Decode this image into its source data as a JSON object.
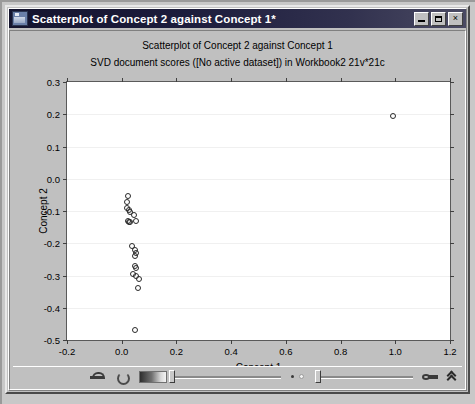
{
  "window": {
    "title": "Scatterplot of Concept 2 against Concept 1*",
    "icon": "chart-window-icon",
    "minimize_label": "",
    "maximize_label": "",
    "close_label": "×"
  },
  "toolbar": {
    "items": [
      {
        "name": "brush-tool-icon",
        "label": ""
      },
      {
        "name": "rotate-tool-icon",
        "label": ""
      },
      {
        "name": "gradient-swatch-icon",
        "label": ""
      },
      {
        "name": "marker-size-slider",
        "value": 0
      },
      {
        "name": "point-density-icon",
        "label": ""
      },
      {
        "name": "zoom-slider",
        "value": 0
      },
      {
        "name": "key-tool-icon",
        "label": ""
      },
      {
        "name": "collapse-chevron-icon",
        "label": ""
      }
    ]
  },
  "chart_data": {
    "type": "scatter",
    "title": "Scatterplot of Concept 2 against Concept 1",
    "subtitle": "SVD document scores ([No active dataset]) in Workbook2 21v*21c",
    "xlabel": "Concept 1",
    "ylabel": "Concept 2",
    "xlim": [
      -0.2,
      1.2
    ],
    "ylim": [
      -0.5,
      0.3
    ],
    "xticks": [
      "-0.2",
      "0.0",
      "0.2",
      "0.4",
      "0.6",
      "0.8",
      "1.0",
      "1.2"
    ],
    "xtick_values": [
      -0.2,
      0.0,
      0.2,
      0.4,
      0.6,
      0.8,
      1.0,
      1.2
    ],
    "yticks": [
      "0.3",
      "0.2",
      "0.1",
      "0.0",
      "-0.1",
      "-0.2",
      "-0.3",
      "-0.4",
      "-0.5"
    ],
    "ytick_values": [
      0.3,
      0.2,
      0.1,
      0.0,
      -0.1,
      -0.2,
      -0.3,
      -0.4,
      -0.5
    ],
    "grid": true,
    "grid_axis": "y",
    "legend": false,
    "marker": "open-circle",
    "marker_color": "#2a2a2a",
    "series": [
      {
        "name": "SVD document scores",
        "points": [
          [
            0.99,
            0.195
          ],
          [
            0.022,
            -0.052
          ],
          [
            0.021,
            -0.072
          ],
          [
            0.018,
            -0.09
          ],
          [
            0.026,
            -0.096
          ],
          [
            0.032,
            -0.104
          ],
          [
            0.046,
            -0.112
          ],
          [
            0.022,
            -0.132
          ],
          [
            0.027,
            -0.133
          ],
          [
            0.03,
            -0.134
          ],
          [
            0.052,
            -0.13
          ],
          [
            0.038,
            -0.21
          ],
          [
            0.05,
            -0.222
          ],
          [
            0.052,
            -0.23
          ],
          [
            0.049,
            -0.238
          ],
          [
            0.05,
            -0.272
          ],
          [
            0.054,
            -0.278
          ],
          [
            0.04,
            -0.296
          ],
          [
            0.052,
            -0.3
          ],
          [
            0.062,
            -0.312
          ],
          [
            0.058,
            -0.34
          ],
          [
            0.05,
            -0.468
          ]
        ]
      }
    ]
  }
}
